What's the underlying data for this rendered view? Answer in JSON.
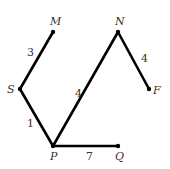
{
  "diagram": {
    "type": "weighted-graph",
    "nodes": [
      {
        "id": "M",
        "label": "M",
        "x": 53,
        "y": 32,
        "label_x": 50,
        "label_y": 25
      },
      {
        "id": "N",
        "label": "N",
        "x": 118,
        "y": 32,
        "label_x": 115,
        "label_y": 25
      },
      {
        "id": "S",
        "label": "S",
        "x": 20,
        "y": 89,
        "label_x": 7,
        "label_y": 93
      },
      {
        "id": "F",
        "label": "F",
        "x": 149,
        "y": 89,
        "label_x": 153,
        "label_y": 94
      },
      {
        "id": "P",
        "label": "P",
        "x": 53,
        "y": 146,
        "label_x": 50,
        "label_y": 160
      },
      {
        "id": "Q",
        "label": "Q",
        "x": 118,
        "y": 146,
        "label_x": 115,
        "label_y": 160
      }
    ],
    "edges": [
      {
        "from": "M",
        "to": "S",
        "weight": "3",
        "label_x": 27,
        "label_y": 56
      },
      {
        "from": "S",
        "to": "P",
        "weight": "1",
        "label_x": 27,
        "label_y": 127
      },
      {
        "from": "P",
        "to": "N",
        "weight": "4",
        "label_x": 75,
        "label_y": 97
      },
      {
        "from": "N",
        "to": "F",
        "weight": "4",
        "label_x": 141,
        "label_y": 62
      },
      {
        "from": "P",
        "to": "Q",
        "weight": "7",
        "label_x": 86,
        "label_y": 160
      }
    ],
    "colors": {
      "edge": "#000000",
      "text": "#333333",
      "background": "#ffffff"
    }
  }
}
